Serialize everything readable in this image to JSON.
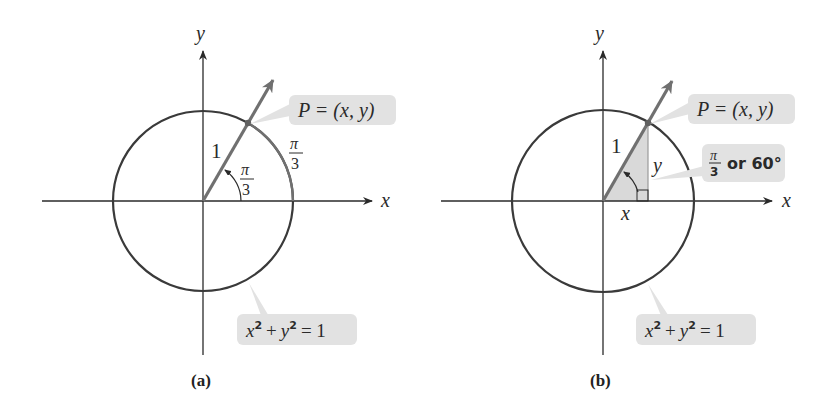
{
  "figure": {
    "colors": {
      "axis": "#2a2a2a",
      "circle": "#3a3a3a",
      "ray": "#707070",
      "callout_bg": "#e2e2e2",
      "shade": "#d9d9d9"
    },
    "panels": [
      {
        "caption": "(a)",
        "axis_x_label": "x",
        "axis_y_label": "y",
        "point_label": "P = (x, y)",
        "radius_label": "1",
        "angle_num": "π",
        "angle_den": "3",
        "arc_num": "π",
        "arc_den": "3",
        "circle_eq": "x² + y² = 1",
        "eq_x": "x",
        "eq_y": "y",
        "eq_sup": "2",
        "eq_plus": "+",
        "eq_rhs": "= 1"
      },
      {
        "caption": "(b)",
        "axis_x_label": "x",
        "axis_y_label": "y",
        "point_label": "P = (x, y)",
        "radius_label": "1",
        "leg_x_label": "x",
        "leg_y_label": "y",
        "angle_num": "π",
        "angle_den": "3",
        "angle_text": "or 60°",
        "circle_eq": "x² + y² = 1",
        "eq_x": "x",
        "eq_y": "y",
        "eq_sup": "2",
        "eq_plus": "+",
        "eq_rhs": "= 1"
      }
    ]
  }
}
